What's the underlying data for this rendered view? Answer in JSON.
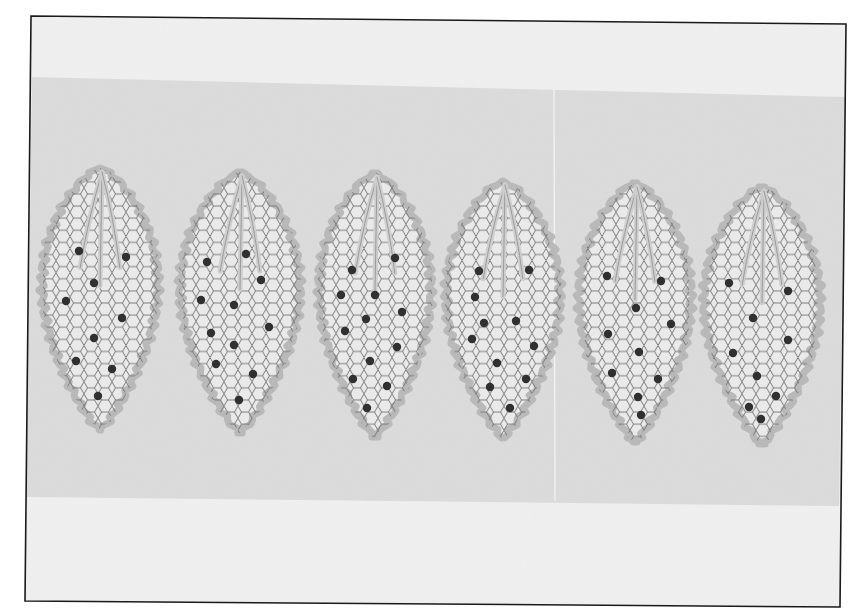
{
  "image": {
    "description": "Grayscale photograph of six pointed oval lace-like leaf shapes, each with a honeycomb (hexagonal) net fill, scalloped border, three vein lines radiating from the top tip, and scattered dark dots, laid in a row across a grey band on white paper, inside a thin black frame.",
    "colors": {
      "page": "#ffffff",
      "paper": "#f1f1f1",
      "band": "#dcdcdc",
      "frame": "#1a1a1a",
      "border": "#b9b9b9",
      "net_fill": "#ececec",
      "net_line": "#6e6e6e",
      "dot": "#2a2a2a",
      "divider_line": "#f7f7f7"
    },
    "frame": {
      "tl": [
        31,
        16
      ],
      "tr": [
        846,
        24
      ],
      "br": [
        840,
        607
      ],
      "bl": [
        25,
        601
      ]
    },
    "band": {
      "top_left_y": 77,
      "top_right_y": 97,
      "bottom_left_y": 497,
      "bottom_right_y": 506
    },
    "divider_x": 554,
    "leaves": [
      {
        "id": 1,
        "cx": 100,
        "top": 168,
        "bottom": 430,
        "halfw": 58,
        "dots": [
          [
            79,
            251
          ],
          [
            126,
            257
          ],
          [
            94,
            283
          ],
          [
            66,
            301
          ],
          [
            122,
            318
          ],
          [
            94,
            338
          ],
          [
            76,
            361
          ],
          [
            112,
            369
          ],
          [
            98,
            396
          ]
        ]
      },
      {
        "id": 2,
        "cx": 240,
        "top": 172,
        "bottom": 433,
        "halfw": 60,
        "dots": [
          [
            246,
            254
          ],
          [
            207,
            262
          ],
          [
            261,
            280
          ],
          [
            201,
            300
          ],
          [
            234,
            305
          ],
          [
            269,
            327
          ],
          [
            211,
            333
          ],
          [
            234,
            345
          ],
          [
            216,
            364
          ],
          [
            253,
            374
          ],
          [
            239,
            400
          ]
        ]
      },
      {
        "id": 3,
        "cx": 375,
        "top": 173,
        "bottom": 437,
        "halfw": 56,
        "dots": [
          [
            395,
            258
          ],
          [
            352,
            270
          ],
          [
            341,
            295
          ],
          [
            375,
            295
          ],
          [
            402,
            312
          ],
          [
            366,
            319
          ],
          [
            345,
            331
          ],
          [
            397,
            347
          ],
          [
            370,
            361
          ],
          [
            353,
            379
          ],
          [
            387,
            386
          ],
          [
            367,
            408
          ]
        ]
      },
      {
        "id": 4,
        "cx": 503,
        "top": 181,
        "bottom": 438,
        "halfw": 57,
        "dots": [
          [
            479,
            271
          ],
          [
            529,
            270
          ],
          [
            475,
            297
          ],
          [
            484,
            323
          ],
          [
            516,
            321
          ],
          [
            472,
            339
          ],
          [
            534,
            346
          ],
          [
            497,
            363
          ],
          [
            526,
            379
          ],
          [
            490,
            387
          ],
          [
            510,
            408
          ]
        ]
      },
      {
        "id": 5,
        "cx": 635,
        "top": 183,
        "bottom": 442,
        "halfw": 56,
        "dots": [
          [
            607,
            276
          ],
          [
            661,
            281
          ],
          [
            636,
            308
          ],
          [
            671,
            324
          ],
          [
            608,
            334
          ],
          [
            639,
            352
          ],
          [
            612,
            373
          ],
          [
            658,
            379
          ],
          [
            638,
            397
          ],
          [
            641,
            415
          ]
        ]
      },
      {
        "id": 6,
        "cx": 762,
        "top": 187,
        "bottom": 444,
        "halfw": 58,
        "dots": [
          [
            729,
            283
          ],
          [
            788,
            291
          ],
          [
            753,
            318
          ],
          [
            788,
            340
          ],
          [
            733,
            353
          ],
          [
            757,
            376
          ],
          [
            776,
            396
          ],
          [
            749,
            407
          ],
          [
            761,
            419
          ]
        ]
      }
    ]
  }
}
